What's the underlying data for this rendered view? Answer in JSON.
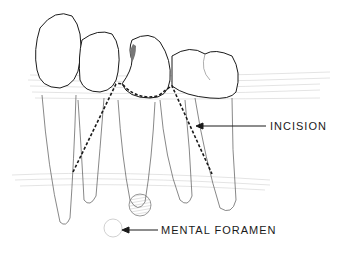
{
  "diagram": {
    "labels": {
      "incision": "INCISION",
      "mental_foramen": "MENTAL FORAMEN"
    },
    "colors": {
      "line": "#1a1a1a",
      "hatch": "#9a9a9a",
      "background": "#ffffff"
    }
  }
}
